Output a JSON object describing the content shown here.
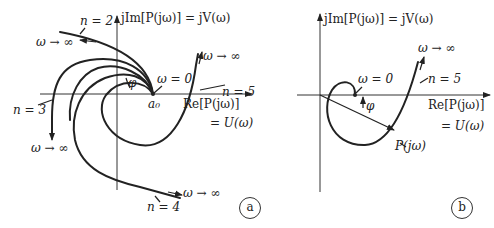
{
  "panel_a": {
    "tag": "a",
    "y_axis_label": "jIm[P(jω)] = jV(ω)",
    "x_axis_label": "Re[P(jω)]",
    "x_axis_label2": "= U(ω)",
    "origin_label": "a₀",
    "omega_zero_label": "ω = 0",
    "phi_label": "φ",
    "curves": [
      {
        "name": "n = 2",
        "end_label": "ω → ∞"
      },
      {
        "name": "n = 3",
        "end_label": "ω → ∞"
      },
      {
        "name": "n = 4",
        "end_label": "ω → ∞"
      },
      {
        "name": "n = 5",
        "end_label": "ω → ∞"
      }
    ]
  },
  "panel_b": {
    "tag": "b",
    "y_axis_label": "jIm[P(jω)] = jV(ω)",
    "x_axis_label": "Re[P(jω)]",
    "x_axis_label2": "= U(ω)",
    "omega_zero_label": "ω = 0",
    "phi_label": "φ",
    "curve_label": "n = 5",
    "end_label": "ω → ∞",
    "vector_label": "P(jω)"
  }
}
